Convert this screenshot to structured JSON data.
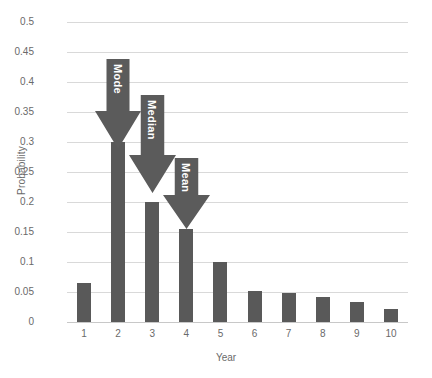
{
  "chart_data": {
    "type": "bar",
    "title": "",
    "xlabel": "Year",
    "ylabel": "Probability",
    "categories": [
      "1",
      "2",
      "3",
      "4",
      "5",
      "6",
      "7",
      "8",
      "9",
      "10"
    ],
    "values": [
      0.065,
      0.3,
      0.2,
      0.155,
      0.1,
      0.052,
      0.048,
      0.042,
      0.033,
      0.022
    ],
    "ylim": [
      0,
      0.5
    ],
    "ytick_labels": [
      "0.5",
      "0.45",
      "0.4",
      "0.35",
      "0.3",
      "0.25",
      "0.2",
      "0.15",
      "0.1",
      "0.05",
      "0"
    ],
    "ytick_values": [
      0.5,
      0.45,
      0.4,
      0.35,
      0.3,
      0.25,
      0.2,
      0.15,
      0.1,
      0.05,
      0
    ],
    "grid": true,
    "legend": "none",
    "bar_color": "#595959",
    "grid_color": "#d9d9d9",
    "text_color": "#6a6a6a",
    "annotations": [
      {
        "label": "Mode",
        "target_category": "2",
        "color": "#5b5b5b"
      },
      {
        "label": "Median",
        "target_category": "3",
        "color": "#5b5b5b"
      },
      {
        "label": "Mean",
        "target_category": "4",
        "color": "#5b5b5b"
      }
    ]
  }
}
